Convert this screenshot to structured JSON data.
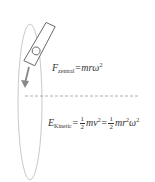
{
  "diagram": {
    "colors": {
      "ellipse": "#bbbbbb",
      "object_stroke": "#555555",
      "arrow": "#888888",
      "dashed_axis": "#999999",
      "text": "#333333"
    },
    "force_equation": {
      "symbol": "F",
      "subscript": "zentral",
      "equals": "=",
      "rhs": "mrω",
      "exponent": "2"
    },
    "energy_equation": {
      "symbol": "E",
      "subscript": "Kinetic",
      "equals1": "=",
      "frac1_num": "1",
      "frac1_den": "2",
      "term1": "mv",
      "term1_exp": "2",
      "equals2": "=",
      "frac2_num": "1",
      "frac2_den": "2",
      "term2a": "mr",
      "term2a_exp": "2",
      "term2b": "ω",
      "term2b_exp": "2"
    }
  }
}
